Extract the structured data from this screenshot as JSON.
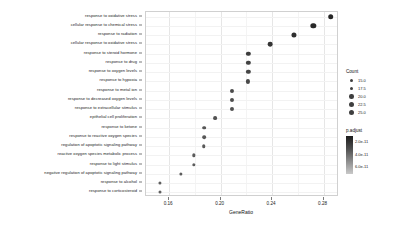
{
  "chart_data": {
    "type": "scatter",
    "title": "",
    "subtitle": "",
    "xlabel": "GeneRatio",
    "ylabel": "",
    "xlim": [
      0.142,
      0.292
    ],
    "xticks": [
      0.16,
      0.2,
      0.24,
      0.28
    ],
    "xticklabels": [
      "0.16",
      "0.20",
      "0.24",
      "0.28"
    ],
    "grid": true,
    "legend_position": "right",
    "categories": [
      "response to oxidative stress",
      "cellular response to chemical stress",
      "response to radiation",
      "cellular response to oxidative stress",
      "response to steroid hormone",
      "response to drug",
      "response to oxygen levels",
      "response to hypoxia",
      "response to metal ion",
      "response to decreased oxygen levels",
      "response to extracellular stimulus",
      "epithelial cell proliferation",
      "response to ketone",
      "response to reactive oxygen species",
      "regulation of apoptotic signaling pathway",
      "reactive oxygen species metabolic process",
      "response to light stimulus",
      "negative regulation of apoptotic signaling pathway",
      "response to alcohol",
      "response to corticosteroid"
    ],
    "points": [
      {
        "term": "response to oxidative stress",
        "GeneRatio": 0.2855,
        "Count": 25.0,
        "p.adjust": 1.9e-11
      },
      {
        "term": "cellular response to chemical stress",
        "GeneRatio": 0.272,
        "Count": 24.0,
        "p.adjust": 2.1e-11
      },
      {
        "term": "response to radiation",
        "GeneRatio": 0.257,
        "Count": 23.0,
        "p.adjust": 2.6e-11
      },
      {
        "term": "cellular response to oxidative stress",
        "GeneRatio": 0.2385,
        "Count": 21.5,
        "p.adjust": 3.1e-11
      },
      {
        "term": "response to steroid hormone",
        "GeneRatio": 0.2215,
        "Count": 20.0,
        "p.adjust": 3.6e-11
      },
      {
        "term": "response to drug",
        "GeneRatio": 0.2215,
        "Count": 20.0,
        "p.adjust": 4e-11
      },
      {
        "term": "response to oxygen levels",
        "GeneRatio": 0.2215,
        "Count": 20.0,
        "p.adjust": 4.3e-11
      },
      {
        "term": "response to hypoxia",
        "GeneRatio": 0.2215,
        "Count": 19.5,
        "p.adjust": 4.6e-11
      },
      {
        "term": "response to metal ion",
        "GeneRatio": 0.2085,
        "Count": 19.0,
        "p.adjust": 4.8e-11
      },
      {
        "term": "response to decreased oxygen levels",
        "GeneRatio": 0.2085,
        "Count": 19.0,
        "p.adjust": 5e-11
      },
      {
        "term": "response to extracellular stimulus",
        "GeneRatio": 0.2085,
        "Count": 19.0,
        "p.adjust": 5.2e-11
      },
      {
        "term": "epithelial cell proliferation",
        "GeneRatio": 0.1955,
        "Count": 18.0,
        "p.adjust": 5.4e-11
      },
      {
        "term": "response to ketone",
        "GeneRatio": 0.187,
        "Count": 17.5,
        "p.adjust": 5.6e-11
      },
      {
        "term": "response to reactive oxygen species",
        "GeneRatio": 0.187,
        "Count": 17.5,
        "p.adjust": 5.8e-11
      },
      {
        "term": "regulation of apoptotic signaling pathway",
        "GeneRatio": 0.187,
        "Count": 17.0,
        "p.adjust": 5.9e-11
      },
      {
        "term": "reactive oxygen species metabolic process",
        "GeneRatio": 0.179,
        "Count": 16.5,
        "p.adjust": 6e-11
      },
      {
        "term": "response to light stimulus",
        "GeneRatio": 0.179,
        "Count": 16.5,
        "p.adjust": 6.1e-11
      },
      {
        "term": "negative regulation of apoptotic signaling pathway",
        "GeneRatio": 0.169,
        "Count": 16.0,
        "p.adjust": 6.2e-11
      },
      {
        "term": "response to alcohol",
        "GeneRatio": 0.1525,
        "Count": 15.5,
        "p.adjust": 6.3e-11
      },
      {
        "term": "response to corticosteroid",
        "GeneRatio": 0.1525,
        "Count": 15.0,
        "p.adjust": 6.4e-11
      }
    ],
    "size_legend": {
      "title": "Count",
      "values": [
        "15.0",
        "17.5",
        "20.0",
        "22.5",
        "25.0"
      ]
    },
    "color_legend": {
      "title": "p.adjust",
      "ticks": [
        "2.0e-11",
        "4.0e-11",
        "6.0e-11"
      ],
      "low_color": "#132b43",
      "high_color": "#cfcfcf"
    }
  }
}
